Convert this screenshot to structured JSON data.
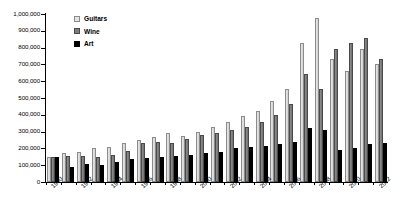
{
  "chart_data": {
    "type": "bar",
    "title": "",
    "xlabel": "",
    "ylabel": "",
    "ylim": [
      0,
      1000000
    ],
    "ytick_labels": [
      "1,000,000",
      "900,000",
      "800,000",
      "700,000",
      "600,000",
      "500,000",
      "400,000",
      "300,000",
      "200,000",
      "100,000",
      "0"
    ],
    "ytick_values": [
      1000000,
      900000,
      800000,
      700000,
      600000,
      500000,
      400000,
      300000,
      200000,
      100000,
      0
    ],
    "grid": false,
    "legend_position": "top-left",
    "categories": [
      1990,
      1991,
      1992,
      1993,
      1994,
      1995,
      1996,
      1997,
      1998,
      1999,
      2000,
      2001,
      2002,
      2003,
      2004,
      2005,
      2006,
      2007,
      2008,
      2009,
      2010,
      2011,
      2012
    ],
    "xtick_labels": [
      "1990",
      "1992",
      "1994",
      "1996",
      "1998",
      "2000",
      "2002",
      "2004",
      "2006",
      "2008",
      "2010",
      "2012"
    ],
    "series": [
      {
        "name": "Guitars",
        "color": "#e0e0e0",
        "values": [
          150000,
          170000,
          180000,
          200000,
          210000,
          230000,
          250000,
          265000,
          290000,
          275000,
          300000,
          330000,
          360000,
          390000,
          420000,
          480000,
          555000,
          825000,
          975000,
          730000,
          660000,
          790000,
          700000
        ]
      },
      {
        "name": "Wine",
        "color": "#7d7d7d",
        "values": [
          150000,
          155000,
          155000,
          150000,
          160000,
          185000,
          230000,
          240000,
          235000,
          255000,
          280000,
          290000,
          310000,
          330000,
          360000,
          400000,
          465000,
          640000,
          555000,
          790000,
          825000,
          860000,
          730000
        ]
      },
      {
        "name": "Art",
        "color": "#000000",
        "values": [
          150000,
          90000,
          110000,
          100000,
          120000,
          135000,
          140000,
          150000,
          155000,
          160000,
          170000,
          180000,
          200000,
          210000,
          215000,
          225000,
          240000,
          320000,
          310000,
          190000,
          200000,
          225000,
          230000
        ]
      }
    ]
  },
  "legend": {
    "items": [
      {
        "label": "Guitars",
        "key": "guitars"
      },
      {
        "label": "Wine",
        "key": "wine"
      },
      {
        "label": "Art",
        "key": "art"
      }
    ]
  }
}
